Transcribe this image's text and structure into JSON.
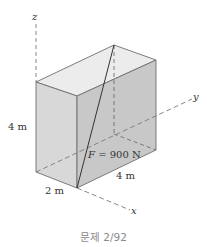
{
  "diagram": {
    "type": "3d-box-force",
    "axes": {
      "x_label": "x",
      "y_label": "y",
      "z_label": "z"
    },
    "dimensions": {
      "height_label": "4 m",
      "depth_label": "2 m",
      "length_label": "4 m"
    },
    "force": {
      "symbol": "F",
      "equals": " = 900 N",
      "value_N": 900
    },
    "colors": {
      "top_face": "#ececec",
      "left_face": "#d6d6d6",
      "front_face": "#c6c6c6",
      "edge": "#6e6e6e",
      "force_line": "#333333",
      "axis_dash": "#7a7a7a"
    }
  },
  "caption": "문제 2/92"
}
